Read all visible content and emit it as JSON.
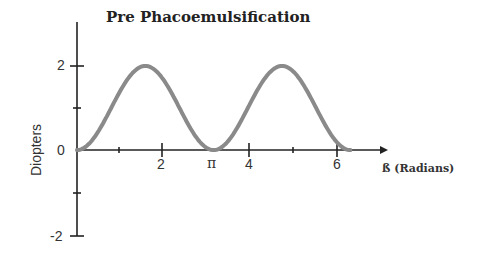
{
  "chart_data": {
    "type": "line",
    "title": "Pre Phacoemulsification",
    "xlabel": "ß (Radians)",
    "ylabel": "Diopters",
    "xlim": [
      0,
      6.6
    ],
    "ylim": [
      -2,
      2.8
    ],
    "x_tick_labels": [
      "2",
      "π",
      "4",
      "6"
    ],
    "x_ticks": [
      1,
      2,
      3.14159,
      4,
      5,
      6
    ],
    "y_tick_labels": [
      "2",
      "0",
      "-2"
    ],
    "y_ticks": [
      2,
      1,
      0,
      -1,
      -2
    ],
    "grid": false,
    "series": [
      {
        "name": "Pre Phacoemulsification",
        "function": "1 - cos(2ß)",
        "x": [
          0,
          0.785,
          1.571,
          2.356,
          3.142,
          3.927,
          4.712,
          5.498,
          6.283
        ],
        "y": [
          0,
          1,
          2,
          1,
          0,
          1,
          2,
          1,
          0
        ]
      }
    ],
    "colors": {
      "curve": "#8a8a8a",
      "axis": "#222222"
    }
  },
  "labels": {
    "title": "Pre Phacoemulsification",
    "ylabel": "Diopters",
    "xlabel": "ß (Radians)",
    "xt": [
      "2",
      "π",
      "4",
      "6"
    ],
    "yt": [
      "2",
      "0",
      "-2"
    ]
  }
}
